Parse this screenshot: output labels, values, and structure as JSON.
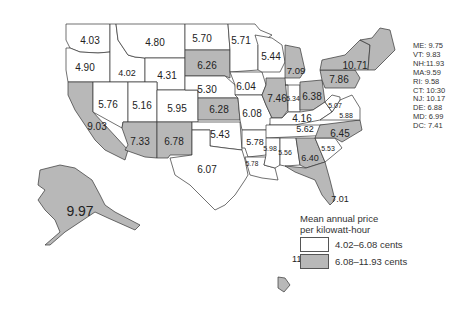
{
  "colors": {
    "low": "#ffffff",
    "high": "#b8b8b8",
    "border": "#333333"
  },
  "legend": {
    "title_line1": "Mean annual price",
    "title_line2": "per kilowatt-hour",
    "items": [
      {
        "label": "4.02–6.08 cents",
        "class": "low"
      },
      {
        "label": "6.08–11.93 cents",
        "class": "high"
      }
    ]
  },
  "side_list": [
    "ME: 9.75",
    "VT: 9.83",
    "NH:11.93",
    "MA:9.59",
    "RI: 9.58",
    "CT: 10:30",
    "NJ: 10.17",
    "DE: 6.88",
    "MD: 6.99",
    "DC: 7.41"
  ],
  "states": [
    {
      "id": "WA",
      "value": "4.03",
      "class": "low"
    },
    {
      "id": "OR",
      "value": "4.90",
      "class": "low"
    },
    {
      "id": "CA",
      "value": "9.03",
      "class": "high"
    },
    {
      "id": "ID",
      "value": "4.02",
      "class": "low"
    },
    {
      "id": "NV",
      "value": "5.76",
      "class": "low"
    },
    {
      "id": "MT",
      "value": "4.80",
      "class": "low"
    },
    {
      "id": "WY",
      "value": "4.31",
      "class": "low"
    },
    {
      "id": "UT",
      "value": "5.16",
      "class": "low"
    },
    {
      "id": "AZ",
      "value": "7.33",
      "class": "high"
    },
    {
      "id": "CO",
      "value": "5.95",
      "class": "low"
    },
    {
      "id": "NM",
      "value": "6.78",
      "class": "high"
    },
    {
      "id": "ND",
      "value": "5.70",
      "class": "low"
    },
    {
      "id": "SD",
      "value": "6.26",
      "class": "high"
    },
    {
      "id": "NE",
      "value": "5.30",
      "class": "low"
    },
    {
      "id": "KS",
      "value": "6.28",
      "class": "high"
    },
    {
      "id": "OK",
      "value": "5.43",
      "class": "low"
    },
    {
      "id": "TX",
      "value": "6.07",
      "class": "low"
    },
    {
      "id": "MN",
      "value": "5.71",
      "class": "low"
    },
    {
      "id": "IA",
      "value": "6.04",
      "class": "low"
    },
    {
      "id": "MO",
      "value": "6.08",
      "class": "low"
    },
    {
      "id": "AR",
      "value": "5.78",
      "class": "low"
    },
    {
      "id": "LA",
      "value": "5.78",
      "class": "low"
    },
    {
      "id": "WI",
      "value": "5.44",
      "class": "low"
    },
    {
      "id": "IL",
      "value": "7.46",
      "class": "high"
    },
    {
      "id": "MI",
      "value": "7.09",
      "class": "high"
    },
    {
      "id": "IN",
      "value": "5.34",
      "class": "low"
    },
    {
      "id": "OH",
      "value": "6.38",
      "class": "high"
    },
    {
      "id": "KY",
      "value": "4.16",
      "class": "low"
    },
    {
      "id": "TN",
      "value": "5.62",
      "class": "low"
    },
    {
      "id": "MS",
      "value": "5.98",
      "class": "low"
    },
    {
      "id": "AL",
      "value": "5.56",
      "class": "low"
    },
    {
      "id": "GA",
      "value": "6.40",
      "class": "high"
    },
    {
      "id": "FL",
      "value": "7.01",
      "class": "high"
    },
    {
      "id": "SC",
      "value": "5.53",
      "class": "low"
    },
    {
      "id": "NC",
      "value": "6.45",
      "class": "high"
    },
    {
      "id": "VA",
      "value": "5.88",
      "class": "low"
    },
    {
      "id": "WV",
      "value": "5.07",
      "class": "low"
    },
    {
      "id": "PA",
      "value": "7.86",
      "class": "high"
    },
    {
      "id": "NY",
      "value": "10.71",
      "class": "high"
    },
    {
      "id": "NE_REGION",
      "value": "",
      "class": "high"
    },
    {
      "id": "AK",
      "value": "9.97",
      "class": "high"
    },
    {
      "id": "HI",
      "value": "11.56",
      "class": "high"
    }
  ]
}
